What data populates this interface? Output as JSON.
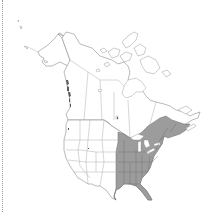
{
  "map": {
    "region": "North America",
    "type": "species range / distribution map",
    "shaded_area": "Eastern United States and southeastern Canada",
    "colors": {
      "background": "#ffffff",
      "land": "#ffffff",
      "boundaries": "#8c8c8c",
      "range_fill": "#9c9c9c",
      "left_rule": "#9a9a9a"
    },
    "shaded_regions": [
      "Texas (east)",
      "Oklahoma (east)",
      "Kansas (east)",
      "Nebraska (east)",
      "Minnesota",
      "Iowa",
      "Missouri",
      "Arkansas",
      "Louisiana",
      "Wisconsin",
      "Illinois",
      "Michigan",
      "Indiana",
      "Ohio",
      "Kentucky",
      "Tennessee",
      "Mississippi",
      "Alabama",
      "Georgia",
      "Florida",
      "South Carolina",
      "North Carolina",
      "Virginia",
      "West Virginia",
      "Maryland",
      "Delaware",
      "Pennsylvania",
      "New Jersey",
      "New York",
      "Connecticut",
      "Rhode Island",
      "Massachusetts",
      "Vermont",
      "New Hampshire",
      "Maine",
      "Ontario (south)",
      "Quebec (south)",
      "New Brunswick",
      "Nova Scotia"
    ],
    "minor_shading": [
      "Pacific Northwest coast (British Columbia islands)",
      "Colorado (small spot)"
    ]
  }
}
